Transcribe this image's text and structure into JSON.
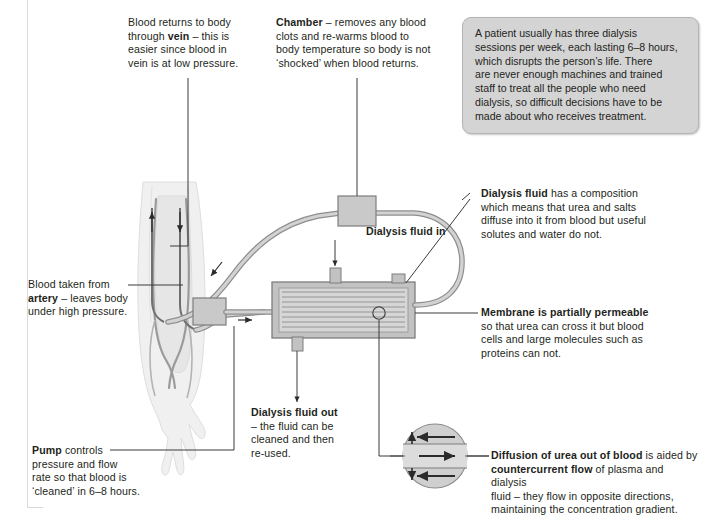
{
  "callouts": {
    "vein": {
      "lines": [
        "Blood returns to body",
        "through <b>vein</b> – this is",
        "easier since blood in",
        "vein is at low pressure."
      ]
    },
    "chamber": {
      "lines": [
        "<b>Chamber</b> – removes any blood",
        "clots and re-warms blood to",
        "body temperature so body is not",
        "‘shocked’ when blood returns."
      ]
    },
    "artery": {
      "lines": [
        "Blood taken from",
        "<b>artery</b> – leaves body",
        "under high pressure."
      ]
    },
    "pump": {
      "lines": [
        "<b>Pump</b> controls",
        "pressure and flow",
        "rate so that blood is",
        "‘cleaned’ in 6–8 hours."
      ]
    },
    "fluid_in": {
      "lines": [
        "<b>Dialysis fluid in</b>"
      ]
    },
    "fluid_out": {
      "lines": [
        "<b>Dialysis fluid out</b>",
        "– the fluid can be",
        "cleaned and then",
        "re-used."
      ]
    },
    "dialysis_fluid": {
      "lines": [
        "<b>Dialysis fluid</b> has a composition",
        "which means that urea and salts",
        "diffuse into it from blood but useful",
        "solutes and water do not."
      ]
    },
    "membrane": {
      "lines": [
        "<b>Membrane is partially permeable</b>",
        "so that urea can cross it but blood",
        "cells and large molecules such as",
        "proteins can not."
      ]
    },
    "diffusion": {
      "lines": [
        "<b>Diffusion of urea out of blood</b> is aided by",
        "<b>countercurrent flow</b> of plasma and dialysis",
        "fluid – they flow in opposite directions,",
        "maintaining the concentration gradient."
      ]
    }
  },
  "infobox": {
    "lines": [
      "A patient usually has three dialysis",
      "sessions per week, each lasting 6–8 hours,",
      "which disrupts the person’s life. There",
      "are never enough machines and trained",
      "staff to treat all the people who need",
      "dialysis, so difficult decisions have to be",
      "made about who receives treatment."
    ]
  },
  "colors": {
    "text": "#231f20",
    "infobox_bg": "#d4d4d4",
    "infobox_border": "#b4b4b4",
    "tube": "#b9b9b9",
    "tube_edge": "#8e8e8e",
    "device_fill": "#c9c9c9",
    "device_edge": "#7d7d7d",
    "arm": "#e8e8e8",
    "leader": "#3a3a3a"
  }
}
